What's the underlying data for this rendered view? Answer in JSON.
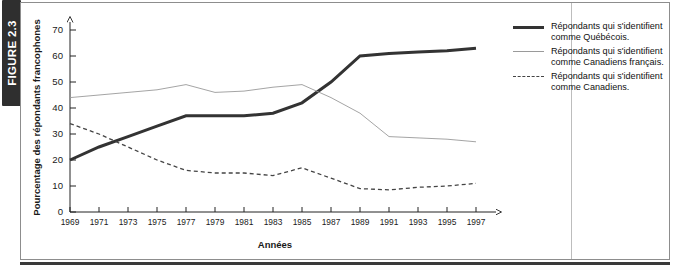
{
  "figure": {
    "band_label": "FIGURE 2.3"
  },
  "chart_data": {
    "type": "line",
    "title": "",
    "xlabel": "Années",
    "ylabel": "Pourcentage des répondants francophones",
    "xlim": [
      1969,
      1997
    ],
    "ylim": [
      0,
      70
    ],
    "grid": false,
    "legend_position": "right",
    "x": [
      1969,
      1971,
      1973,
      1975,
      1977,
      1979,
      1981,
      1983,
      1985,
      1987,
      1989,
      1991,
      1993,
      1995,
      1997
    ],
    "xticklabels": [
      "1969",
      "1971",
      "1973",
      "1975",
      "1977",
      "1979",
      "1981",
      "1983",
      "1985",
      "1987",
      "1989",
      "1991",
      "1993",
      "1995",
      "1997"
    ],
    "yticklabels": [
      "0",
      "10",
      "20",
      "30",
      "40",
      "50",
      "60",
      "70"
    ],
    "yticks": [
      0,
      10,
      20,
      30,
      40,
      50,
      60,
      70
    ],
    "series": [
      {
        "name": "Répondants qui s'identifient comme Québécois.",
        "style": "thick-solid",
        "color": "#333333",
        "values": [
          20,
          25,
          29,
          33,
          37,
          37,
          37,
          38,
          42,
          50,
          60,
          61,
          61.5,
          62,
          63
        ]
      },
      {
        "name": "Répondants qui s'identifient comme Canadiens français.",
        "style": "thin-solid",
        "color": "#9a9a9a",
        "values": [
          44,
          45,
          46,
          47,
          49,
          46,
          46.5,
          48,
          49,
          44,
          38,
          29,
          28.5,
          28,
          27
        ]
      },
      {
        "name": "Répondants qui s'identifient comme Canadiens.",
        "style": "dashed",
        "color": "#444444",
        "values": [
          34,
          30,
          25,
          20,
          16,
          15,
          15,
          14,
          17,
          13,
          9,
          8.5,
          9.5,
          10,
          11
        ]
      }
    ]
  },
  "legend": {
    "items": [
      {
        "line1": "Répondants qui s'identifient",
        "line2": "comme Québécois."
      },
      {
        "line1": "Répondants qui s'identifient",
        "line2": "comme Canadiens français."
      },
      {
        "line1": "Répondants qui s'identifient",
        "line2": "comme Canadiens."
      }
    ]
  }
}
